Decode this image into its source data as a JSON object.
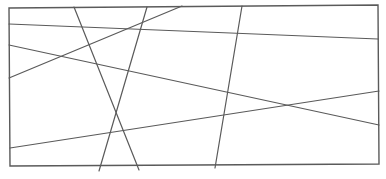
{
  "canvas": {
    "width": 386,
    "height": 179,
    "background": "#ffffff"
  },
  "style": {
    "stroke_color": "#5a5a5a",
    "frame_stroke_width": 1.4,
    "line_stroke_width": 1.2
  },
  "frame": {
    "points": [
      [
        9,
        8
      ],
      [
        378,
        5
      ],
      [
        379,
        164
      ],
      [
        10,
        166
      ]
    ]
  },
  "lines": [
    {
      "id": "line-a",
      "x1": 9,
      "y1": 24,
      "x2": 378,
      "y2": 39
    },
    {
      "id": "line-b",
      "x1": 9,
      "y1": 45,
      "x2": 379,
      "y2": 125
    },
    {
      "id": "line-c",
      "x1": 9,
      "y1": 78,
      "x2": 182,
      "y2": 6
    },
    {
      "id": "line-d",
      "x1": 10,
      "y1": 148,
      "x2": 379,
      "y2": 91
    },
    {
      "id": "line-e",
      "x1": 74,
      "y1": 7,
      "x2": 139,
      "y2": 170
    },
    {
      "id": "line-f",
      "x1": 147,
      "y1": 7,
      "x2": 99,
      "y2": 171
    },
    {
      "id": "line-g",
      "x1": 242,
      "y1": 6,
      "x2": 215,
      "y2": 168
    }
  ]
}
